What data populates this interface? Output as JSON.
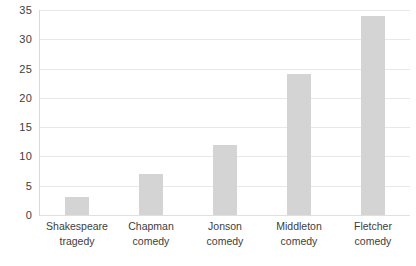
{
  "chart_data": {
    "type": "bar",
    "title": "",
    "subtitle": "",
    "xlabel": "",
    "ylabel": "",
    "categories": [
      "Shakespeare tragedy",
      "Chapman comedy",
      "Jonson comedy",
      "Middleton comedy",
      "Fletcher comedy"
    ],
    "values": [
      3,
      7,
      12,
      24,
      34
    ],
    "ylim": [
      0,
      35
    ],
    "yticks": [
      0,
      5,
      10,
      15,
      20,
      25,
      30,
      35
    ],
    "ytick_labels": [
      "0",
      "5",
      "10",
      "15",
      "20",
      "25",
      "30",
      "35"
    ],
    "grid": true,
    "grid_axis": "y",
    "legend": false,
    "legend_position": "none",
    "bar_color": "#d4d4d4",
    "gridline_color": "#e8e8e8",
    "axis_line_color": "#d9d9d9",
    "tick_label_color": "#3d3d3d"
  }
}
